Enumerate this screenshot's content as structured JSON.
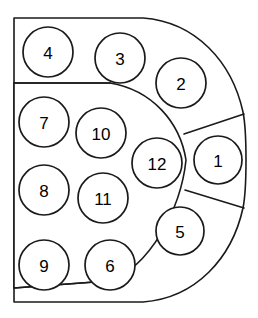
{
  "diagram": {
    "type": "region-packing-diagram",
    "canvas": {
      "width": 258,
      "height": 318
    },
    "colors": {
      "background": "#ffffff",
      "stroke": "#1a1a1a",
      "fill": "#ffffff",
      "label": "#000000"
    },
    "outline": {
      "name": "d-shape-outline",
      "description": "Flat vertical left edge with rounded right arc forming a D",
      "left_edge_x": 14,
      "top_y": 18,
      "bottom_y": 302,
      "right_extent_x": 247
    },
    "inner_arc": {
      "name": "inner-arc",
      "description": "Large oval arc separating the central cluster from the outer band",
      "top_y": 83,
      "bottom_y": 287,
      "right_extent_x": 186
    },
    "dividers": [
      {
        "name": "divider-top-horizontal",
        "from": [
          14,
          83
        ],
        "to": [
          140,
          83
        ]
      },
      {
        "name": "divider-bottom-horizontal",
        "from": [
          14,
          288
        ],
        "to": [
          140,
          281
        ]
      },
      {
        "name": "divider-radial-upper",
        "from": [
          186,
          133
        ],
        "to": [
          243,
          114
        ]
      },
      {
        "name": "divider-radial-lower",
        "from": [
          186,
          190
        ],
        "to": [
          243,
          207
        ]
      }
    ],
    "nodes": [
      {
        "id": "node-1",
        "label": "1",
        "cx": 218,
        "cy": 160,
        "r": 24
      },
      {
        "id": "node-2",
        "label": "2",
        "cx": 181,
        "cy": 83,
        "r": 25
      },
      {
        "id": "node-3",
        "label": "3",
        "cx": 120,
        "cy": 58,
        "r": 25
      },
      {
        "id": "node-4",
        "label": "4",
        "cx": 48,
        "cy": 52,
        "r": 25
      },
      {
        "id": "node-5",
        "label": "5",
        "cx": 180,
        "cy": 231,
        "r": 24
      },
      {
        "id": "node-6",
        "label": "6",
        "cx": 110,
        "cy": 265,
        "r": 25
      },
      {
        "id": "node-7",
        "label": "7",
        "cx": 44,
        "cy": 122,
        "r": 25
      },
      {
        "id": "node-8",
        "label": "8",
        "cx": 44,
        "cy": 190,
        "r": 25
      },
      {
        "id": "node-9",
        "label": "9",
        "cx": 44,
        "cy": 265,
        "r": 25
      },
      {
        "id": "node-10",
        "label": "10",
        "cx": 101,
        "cy": 133,
        "r": 25
      },
      {
        "id": "node-11",
        "label": "11",
        "cx": 103,
        "cy": 198,
        "r": 25
      },
      {
        "id": "node-12",
        "label": "12",
        "cx": 157,
        "cy": 163,
        "r": 25
      }
    ]
  }
}
